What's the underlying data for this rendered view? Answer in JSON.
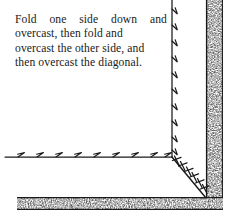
{
  "figure": {
    "name": "mitered-corner-overcast-stitch-diagram",
    "background_color": "#ffffff",
    "ink_color": "#1a1a1a",
    "caption": {
      "full_text": "Fold one side down and overcast, then fold and overcast the other side, and then overcast the diagonal.",
      "lines": [
        "Fold one side down and",
        "overcast, then fold and",
        "overcast the other side, and",
        "then overcast the diagonal."
      ],
      "line1_words": [
        "Fold",
        "one",
        "side",
        "down",
        "and"
      ]
    },
    "seams": {
      "vertical": {
        "label": "vertical-folded-edge-seam",
        "x": 172,
        "y_start": 0,
        "y_end": 157,
        "stitch_count": 10,
        "stitch_spacing": 16
      },
      "horizontal": {
        "label": "horizontal-folded-edge-seam",
        "y": 157,
        "x_start": 5,
        "x_end": 172,
        "stitch_count": 9,
        "stitch_spacing": 19
      },
      "diagonal": {
        "label": "diagonal-mitre-seam",
        "x_start": 172,
        "y_start": 157,
        "x_end": 206,
        "y_end": 198,
        "stitch_count": 6,
        "stitch_type": "cross-overcast"
      }
    },
    "fabric_bands": {
      "right_edge": {
        "label": "right-raw-edge-band",
        "x": 206,
        "y": 0,
        "width": 17,
        "height": 198
      },
      "bottom_edge": {
        "label": "bottom-raw-edge-band",
        "x": 17,
        "y": 197,
        "width": 206,
        "height": 13
      }
    }
  }
}
